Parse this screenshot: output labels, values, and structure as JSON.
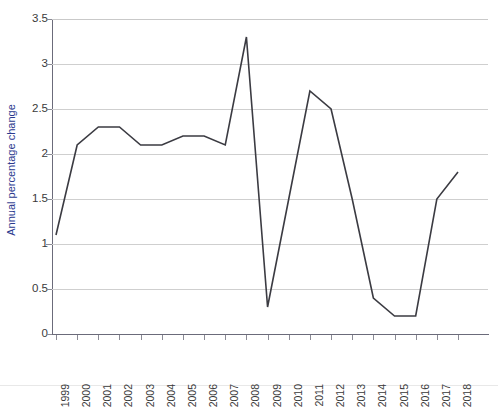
{
  "chart_data": {
    "type": "line",
    "title": "",
    "xlabel": "",
    "ylabel": "Annual percentage change",
    "categories": [
      "1999",
      "2000",
      "2001",
      "2002",
      "2003",
      "2004",
      "2005",
      "2006",
      "2007",
      "2008",
      "2009",
      "2010",
      "2011",
      "2012",
      "2013",
      "2014",
      "2015",
      "2016",
      "2017",
      "2018"
    ],
    "values": [
      1.1,
      2.1,
      2.3,
      2.3,
      2.1,
      2.1,
      2.2,
      2.2,
      2.1,
      3.3,
      0.3,
      1.5,
      2.7,
      2.5,
      1.5,
      0.4,
      0.2,
      0.2,
      1.5,
      1.8
    ],
    "series": [
      {
        "name": "Annual percentage change",
        "values": [
          1.1,
          2.1,
          2.3,
          2.3,
          2.1,
          2.1,
          2.2,
          2.2,
          2.1,
          3.3,
          0.3,
          1.5,
          2.7,
          2.5,
          1.5,
          0.4,
          0.2,
          0.2,
          1.5,
          1.8
        ]
      }
    ],
    "ylim": [
      0,
      3.5
    ],
    "yticks": [
      0,
      0.5,
      1,
      1.5,
      2,
      2.5,
      3,
      3.5
    ],
    "ytick_labels": [
      "0",
      "0.5",
      "1",
      "1.5",
      "2",
      "2.5",
      "3",
      "3.5"
    ],
    "grid": "horizontal",
    "legend": "none",
    "line_color": "#3b3b42",
    "grid_color": "#cfcfcf",
    "axis_color": "#6b6b7a",
    "ylabel_color": "#2b3a8f",
    "tick_label_color": "#3a3a3a",
    "background": "#ffffff"
  }
}
